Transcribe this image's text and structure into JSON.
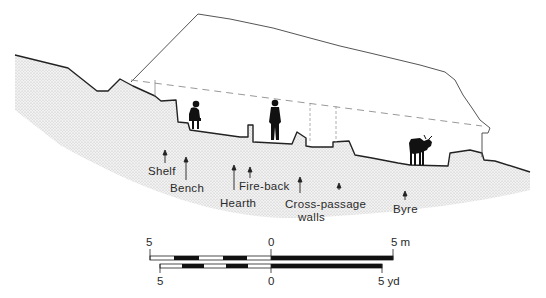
{
  "diagram": {
    "type": "cross-section",
    "colors": {
      "ground_fill": "#e2e2e2",
      "outline": "#222222",
      "roof_line": "#555555",
      "dashed_line": "#999999",
      "figures": "#111111"
    },
    "labels": [
      {
        "id": "shelf",
        "text": "Shelf"
      },
      {
        "id": "bench",
        "text": "Bench"
      },
      {
        "id": "hearth",
        "text": "Hearth"
      },
      {
        "id": "fire_back",
        "text": "Fire-back"
      },
      {
        "id": "cross_passage_line1",
        "text": "Cross-passage"
      },
      {
        "id": "cross_passage_line2",
        "text": "walls"
      },
      {
        "id": "byre",
        "text": "Byre"
      }
    ],
    "figures": [
      "seated-person",
      "standing-person",
      "cow"
    ]
  },
  "scale_bars": {
    "metric": {
      "left_label": "5",
      "center_label": "0",
      "right_label": "5 m"
    },
    "imperial": {
      "left_label": "5",
      "center_label": "0",
      "right_label": "5 yd"
    }
  }
}
